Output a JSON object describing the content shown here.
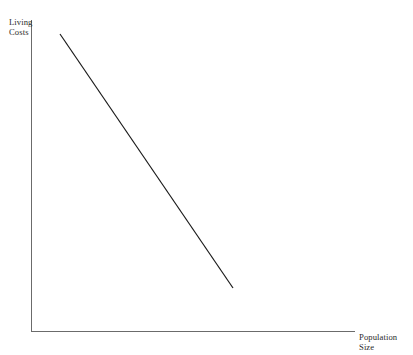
{
  "chart_data": {
    "type": "line",
    "title": "",
    "subtitle": "",
    "xlabel": "Population\nSize",
    "ylabel": "Living\nCosts",
    "grid": false,
    "legend": null,
    "axes": {
      "x_ticks": [],
      "y_ticks": [],
      "x_tick_labels": [],
      "y_tick_labels": [],
      "xlim": [
        0,
        1
      ],
      "ylim": [
        0,
        1
      ],
      "origin_px": [
        31,
        331
      ],
      "x_axis_end_px": [
        355,
        331
      ],
      "y_axis_top_px": [
        31,
        20
      ]
    },
    "series": [
      {
        "name": "living-costs-vs-population",
        "relationship": "negative",
        "color": "#1a1a1a",
        "line_width": 1.2,
        "points_px": [
          [
            60,
            34
          ],
          [
            233,
            288
          ]
        ],
        "x": [
          0.09,
          0.62
        ],
        "values": [
          0.955,
          0.138
        ]
      }
    ],
    "annotations": []
  },
  "labels": {
    "y_axis": "Living\nCosts",
    "x_axis": "Population\nSize"
  },
  "colors": {
    "background": "#ffffff",
    "axis": "#6b6b6b",
    "data_line": "#1a1a1a",
    "text": "#2b2b2b"
  }
}
